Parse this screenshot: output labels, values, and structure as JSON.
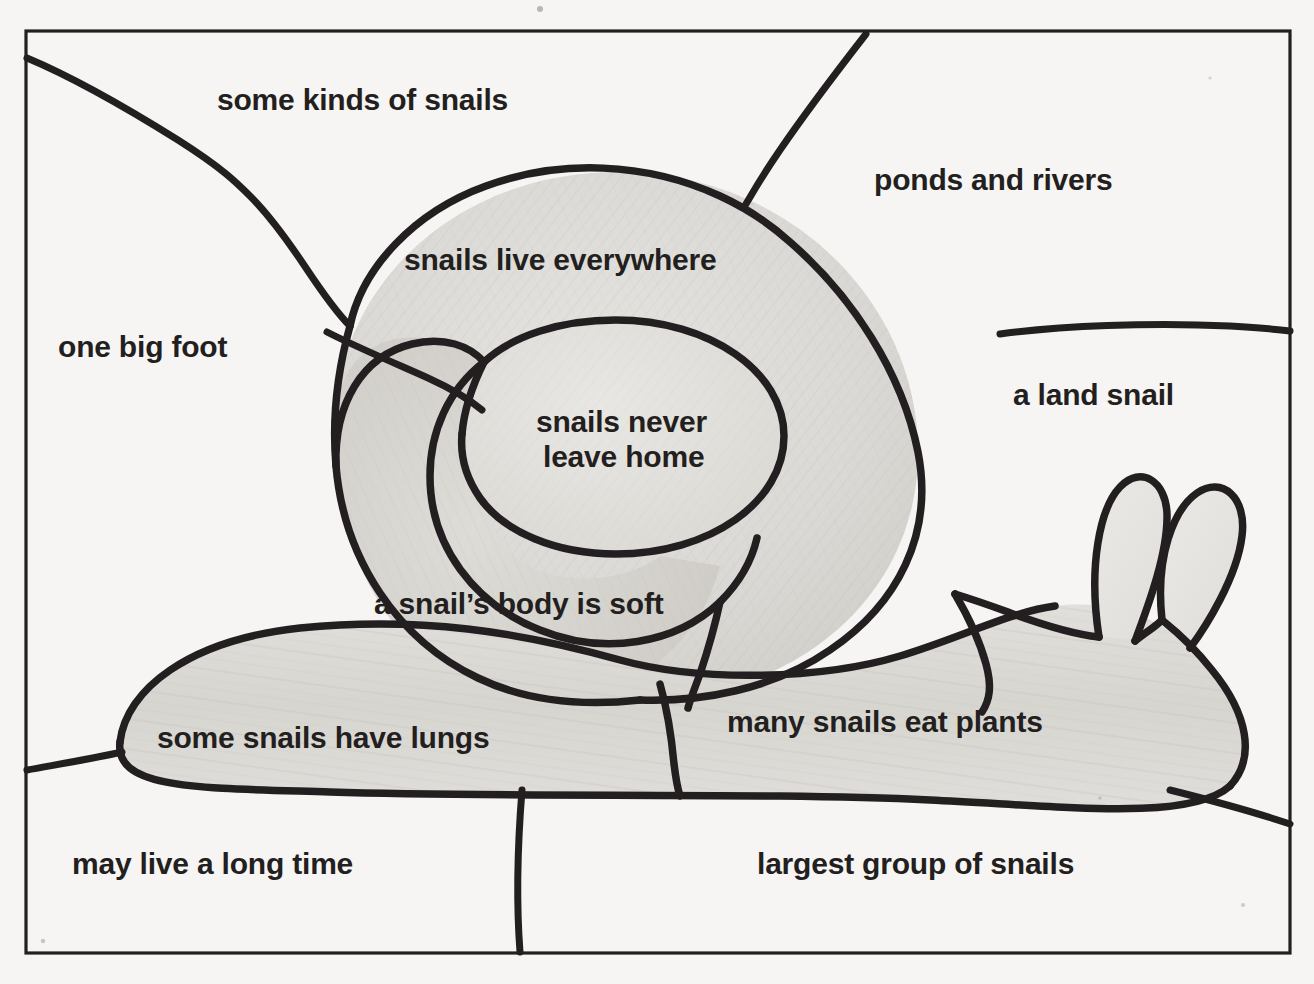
{
  "document": {
    "type": "worksheet-diagram",
    "subject": "snail",
    "background_color": "#f6f5f3",
    "ink_color": "#231f20",
    "shade_color": "#d8d6d2"
  },
  "frame": {
    "name": "page-border",
    "x": 26,
    "y": 31,
    "width": 1264,
    "height": 922
  },
  "labels": [
    {
      "id": "some-kinds-of-snails",
      "text": "some kinds of snails",
      "x": 217,
      "y": 83,
      "align": "left"
    },
    {
      "id": "ponds-and-rivers",
      "text": "ponds and rivers",
      "x": 874,
      "y": 163,
      "align": "left"
    },
    {
      "id": "snails-live-everywhere",
      "text": "snails live everywhere",
      "x": 404,
      "y": 243,
      "align": "left"
    },
    {
      "id": "one-big-foot",
      "text": "one big foot",
      "x": 58,
      "y": 330,
      "align": "left"
    },
    {
      "id": "a-land-snail",
      "text": "a land snail",
      "x": 1013,
      "y": 378,
      "align": "left"
    },
    {
      "id": "snails-never-leave-home-line1",
      "text": "snails never",
      "x": 540,
      "y": 405,
      "align": "center"
    },
    {
      "id": "snails-never-leave-home-line2",
      "text": "leave home",
      "x": 545,
      "y": 440,
      "align": "center"
    },
    {
      "id": "a-snails-body-is-soft",
      "text": "a snail’s body is soft",
      "x": 374,
      "y": 587,
      "align": "left"
    },
    {
      "id": "many-snails-eat-plants",
      "text": "many snails eat plants",
      "x": 727,
      "y": 705,
      "align": "left"
    },
    {
      "id": "some-snails-have-lungs",
      "text": "some snails have lungs",
      "x": 157,
      "y": 721,
      "align": "left"
    },
    {
      "id": "may-live-a-long-time",
      "text": "may live a long time",
      "x": 72,
      "y": 847,
      "align": "left"
    },
    {
      "id": "largest-group-of-snails",
      "text": "largest group of snails",
      "x": 757,
      "y": 847,
      "align": "left"
    }
  ],
  "drawing_parts": [
    {
      "id": "shell-outer",
      "name": "snail-shell-outer-spiral"
    },
    {
      "id": "shell-inner",
      "name": "snail-shell-inner-whorl"
    },
    {
      "id": "shell-center",
      "name": "snail-shell-center"
    },
    {
      "id": "body-foot",
      "name": "snail-body-foot"
    },
    {
      "id": "head",
      "name": "snail-head"
    },
    {
      "id": "tentacle-left",
      "name": "snail-tentacle-left"
    },
    {
      "id": "tentacle-right",
      "name": "snail-tentacle-right"
    }
  ],
  "leader_lines": [
    {
      "id": "leader-some-kinds-of-snails",
      "from": "shell-top-left",
      "to": "border-left"
    },
    {
      "id": "leader-ponds-and-rivers",
      "from": "shell-top",
      "to": "border-top"
    },
    {
      "id": "leader-one-big-foot",
      "from": "shell-left",
      "to": "border-left"
    },
    {
      "id": "leader-a-land-snail",
      "from": "head-top",
      "to": "border-right"
    },
    {
      "id": "leader-some-snails-have-lungs",
      "from": "foot-tail",
      "to": "border-left"
    },
    {
      "id": "leader-may-live-a-long-time",
      "from": "foot-bottom",
      "to": "border-bottom"
    },
    {
      "id": "leader-largest-group-of-snails",
      "from": "head-bottom",
      "to": "border-right"
    }
  ]
}
